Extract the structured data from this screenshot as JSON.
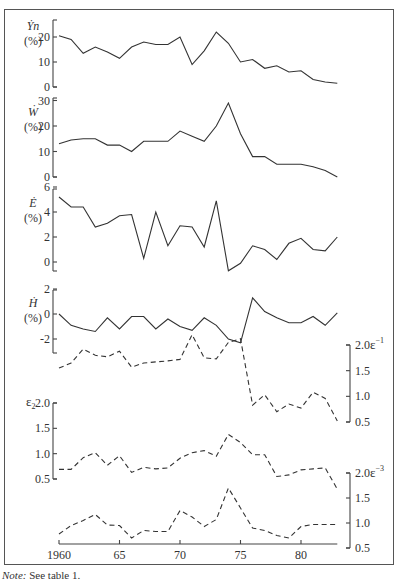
{
  "note": {
    "prefix": "Note:",
    "text": " See table 1."
  },
  "chart_data": [
    {
      "type": "line",
      "panel": "Yn",
      "ylabel": "Ẏn (%)",
      "ylabel_var": "Ẏn",
      "ylabel_unit": "(%)",
      "axis_side": "left",
      "ylim": [
        0,
        25
      ],
      "yticks": [
        0,
        10,
        20
      ],
      "line_style": "solid",
      "x": [
        1960,
        1961,
        1962,
        1963,
        1964,
        1965,
        1966,
        1967,
        1968,
        1969,
        1970,
        1971,
        1972,
        1973,
        1974,
        1975,
        1976,
        1977,
        1978,
        1979,
        1980,
        1981,
        1982,
        1983
      ],
      "values": [
        20.5,
        19,
        13.5,
        16,
        14,
        11.5,
        16,
        18,
        17,
        17,
        20,
        9,
        14.5,
        22,
        17.5,
        10,
        11,
        7.5,
        8.5,
        6,
        6.5,
        3,
        2,
        1.5
      ]
    },
    {
      "type": "line",
      "panel": "W",
      "ylabel": "Ẇ (%)",
      "ylabel_var": "Ẇ",
      "ylabel_unit": "(%)",
      "axis_side": "left",
      "ylim": [
        0,
        30
      ],
      "yticks": [
        0,
        10,
        20,
        30
      ],
      "line_style": "solid",
      "x": [
        1960,
        1961,
        1962,
        1963,
        1964,
        1965,
        1966,
        1967,
        1968,
        1969,
        1970,
        1971,
        1972,
        1973,
        1974,
        1975,
        1976,
        1977,
        1978,
        1979,
        1980,
        1981,
        1982,
        1983
      ],
      "values": [
        13,
        14.5,
        15,
        15,
        12.5,
        12.5,
        10,
        14,
        14,
        14,
        18,
        16,
        14,
        20,
        29,
        17,
        8,
        8,
        5,
        5,
        5,
        4,
        2.5,
        0
      ]
    },
    {
      "type": "line",
      "panel": "E",
      "ylabel": "Ė (%)",
      "ylabel_var": "Ė",
      "ylabel_unit": "(%)",
      "axis_side": "left",
      "ylim": [
        -0.8,
        6
      ],
      "yticks": [
        0,
        2,
        4,
        6
      ],
      "line_style": "solid",
      "x": [
        1960,
        1961,
        1962,
        1963,
        1964,
        1965,
        1966,
        1967,
        1968,
        1969,
        1970,
        1971,
        1972,
        1973,
        1974,
        1975,
        1976,
        1977,
        1978,
        1979,
        1980,
        1981,
        1982,
        1983
      ],
      "values": [
        5.2,
        4.4,
        4.4,
        2.8,
        3.1,
        3.7,
        3.8,
        0.3,
        4.0,
        1.3,
        2.9,
        2.8,
        1.2,
        4.9,
        -0.7,
        -0.1,
        1.3,
        1.0,
        0.2,
        1.5,
        1.9,
        1.0,
        0.9,
        2.0
      ]
    },
    {
      "type": "line",
      "panel": "H",
      "ylabel": "Ḣ (%)",
      "ylabel_var": "Ḣ",
      "ylabel_unit": "(%)",
      "axis_side": "left",
      "ylim": [
        -3,
        2
      ],
      "yticks": [
        -2,
        0,
        2
      ],
      "line_style": "solid",
      "x": [
        1960,
        1961,
        1962,
        1963,
        1964,
        1965,
        1966,
        1967,
        1968,
        1969,
        1970,
        1971,
        1972,
        1973,
        1974,
        1975,
        1976,
        1977,
        1978,
        1979,
        1980,
        1981,
        1982,
        1983
      ],
      "values": [
        0,
        -0.9,
        -1.2,
        -1.4,
        -0.3,
        -1.2,
        -0.2,
        -0.2,
        -1.2,
        -0.4,
        -1.0,
        -1.3,
        -0.3,
        -0.9,
        -2.0,
        -2.3,
        1.3,
        0.2,
        -0.3,
        -0.7,
        -0.7,
        -0.2,
        -0.9,
        0.1
      ]
    },
    {
      "type": "line",
      "panel": "eps_minus1",
      "ylabel": "ε−1",
      "ylabel_var": "ε",
      "ylabel_sub": "−1",
      "axis_side": "right",
      "ylim": [
        0.5,
        2.0
      ],
      "yticks": [
        0.5,
        1.0,
        1.5,
        2.0
      ],
      "line_style": "dashed",
      "x": [
        1960,
        1961,
        1962,
        1963,
        1964,
        1965,
        1966,
        1967,
        1968,
        1969,
        1970,
        1971,
        1972,
        1973,
        1974,
        1975,
        1976,
        1977,
        1978,
        1979,
        1980,
        1981,
        1982,
        1983
      ],
      "values": [
        1.55,
        1.65,
        1.92,
        1.8,
        1.77,
        1.88,
        1.57,
        1.65,
        1.67,
        1.69,
        1.72,
        2.2,
        1.75,
        1.73,
        2.05,
        2.12,
        0.83,
        1.03,
        0.7,
        0.85,
        0.77,
        1.08,
        0.96,
        0.52
      ]
    },
    {
      "type": "line",
      "panel": "eps_2",
      "ylabel": "ε2",
      "ylabel_var": "ε",
      "ylabel_sub": "2",
      "axis_side": "left",
      "ylim": [
        0.5,
        2.0
      ],
      "yticks": [
        0.5,
        1.0,
        1.5,
        2.0
      ],
      "line_style": "dashed",
      "x": [
        1960,
        1961,
        1962,
        1963,
        1964,
        1965,
        1966,
        1967,
        1968,
        1969,
        1970,
        1971,
        1972,
        1973,
        1974,
        1975,
        1976,
        1977,
        1978,
        1979,
        1980,
        1981,
        1982,
        1983
      ],
      "values": [
        0.69,
        0.69,
        0.92,
        1.02,
        0.77,
        0.96,
        0.63,
        0.73,
        0.7,
        0.72,
        0.91,
        1.02,
        1.06,
        0.95,
        1.38,
        1.22,
        0.98,
        0.98,
        0.55,
        0.58,
        0.68,
        0.7,
        0.72,
        0.3
      ]
    },
    {
      "type": "line",
      "panel": "eps_minus3",
      "ylabel": "ε−3",
      "ylabel_var": "ε",
      "ylabel_sub": "−3",
      "axis_side": "right",
      "ylim": [
        0.5,
        2.0
      ],
      "yticks": [
        0.5,
        1.0,
        1.5,
        2.0
      ],
      "line_style": "dashed",
      "x": [
        1960,
        1961,
        1962,
        1963,
        1964,
        1965,
        1966,
        1967,
        1968,
        1969,
        1970,
        1971,
        1972,
        1973,
        1974,
        1975,
        1976,
        1977,
        1978,
        1979,
        1980,
        1981,
        1982,
        1983
      ],
      "values": [
        0.78,
        0.95,
        1.05,
        1.17,
        0.96,
        0.95,
        0.7,
        0.85,
        0.83,
        0.83,
        1.25,
        1.12,
        0.93,
        1.07,
        1.7,
        1.3,
        0.9,
        0.85,
        0.75,
        0.7,
        0.93,
        0.97,
        0.97,
        0.97
      ]
    }
  ],
  "x_axis": {
    "ticks": [
      1960,
      1965,
      1970,
      1975,
      1980
    ],
    "tick_labels": [
      "1960",
      "65",
      "70",
      "75",
      "80"
    ],
    "range": [
      1960,
      1983
    ]
  }
}
